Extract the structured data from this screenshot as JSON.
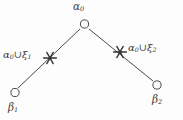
{
  "figure": {
    "type": "wedge-tree-diagram",
    "background_color": "#fdfdfd",
    "stroke_color": "#4a4a4a",
    "text_color": "#3a3a3a"
  },
  "nodes": {
    "apex": {
      "name": "alpha-zero",
      "label_alpha": "α",
      "label_sub": "0",
      "marker": "open-circle",
      "x": 84,
      "y": 23
    },
    "beta1": {
      "name": "beta-one",
      "label_beta": "β",
      "label_sub": "1",
      "marker": "open-circle",
      "x": 15,
      "y": 93
    },
    "beta2": {
      "name": "beta-two",
      "label_beta": "β",
      "label_sub": "2",
      "marker": "open-circle",
      "x": 157,
      "y": 85
    }
  },
  "markers": {
    "left_star": {
      "name": "left-star-marker",
      "glyph": "star",
      "x": 50,
      "y": 58,
      "label_alpha": "α",
      "label_alpha_sub": "0",
      "label_union": "∪",
      "label_xi": "ξ",
      "label_xi_sub": "1"
    },
    "right_star": {
      "name": "right-star-marker",
      "glyph": "star",
      "x": 120,
      "y": 52,
      "label_alpha": "α",
      "label_alpha_sub": "0",
      "label_union": "∪",
      "label_xi": "ξ",
      "label_xi_sub": "2"
    }
  },
  "edges": [
    {
      "name": "edge-apex-to-beta1",
      "from": "apex",
      "to": "beta1",
      "x1": 80,
      "y1": 29,
      "x2": 18,
      "y2": 88
    },
    {
      "name": "edge-apex-to-beta2",
      "from": "apex",
      "to": "beta2",
      "x1": 89,
      "y1": 29,
      "x2": 153,
      "y2": 81
    }
  ]
}
